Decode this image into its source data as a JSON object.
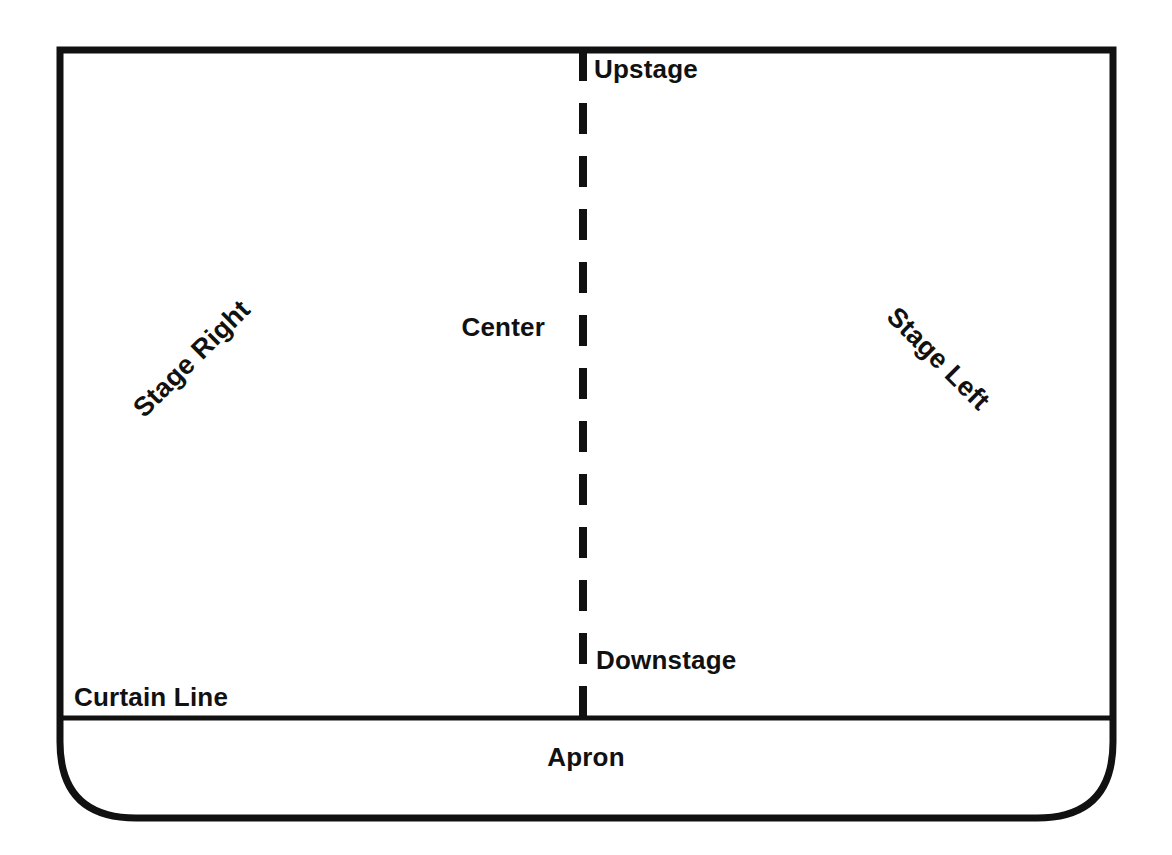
{
  "diagram": {
    "colors": {
      "stroke": "#111111",
      "background": "#ffffff",
      "text": "#111111"
    },
    "labels": {
      "upstage": "Upstage",
      "downstage": "Downstage",
      "center": "Center",
      "stage_right": "Stage Right",
      "stage_left": "Stage Left",
      "curtain_line": "Curtain Line",
      "apron": "Apron"
    },
    "rotation": {
      "stage_right_deg": "-45",
      "stage_left_deg": "45"
    },
    "regions": [
      {
        "name": "stage-floor",
        "label": "Stage Floor"
      },
      {
        "name": "apron",
        "label": "Apron"
      }
    ]
  }
}
